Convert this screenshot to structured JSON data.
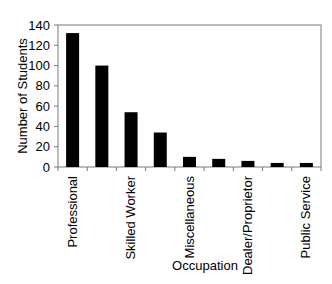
{
  "chart_data": {
    "type": "bar",
    "title": "",
    "xlabel": "Occupation",
    "ylabel": "Number of Students",
    "ylim": [
      0,
      140
    ],
    "yticks": [
      0,
      20,
      40,
      60,
      80,
      100,
      120,
      140
    ],
    "grid": false,
    "legend": null,
    "categories": [
      "Professional",
      "",
      "Skilled Worker",
      "",
      "Miscellaneous",
      "",
      "Dealer/Proprietor",
      "",
      "Public Service"
    ],
    "visible_tick_labels": [
      "Professional",
      "Skilled Worker",
      "Miscellaneous",
      "Dealer/Proprietor",
      "Public Service"
    ],
    "values": [
      132,
      100,
      54,
      34,
      10,
      8,
      6,
      4,
      4
    ],
    "bar_color": "#000000"
  }
}
